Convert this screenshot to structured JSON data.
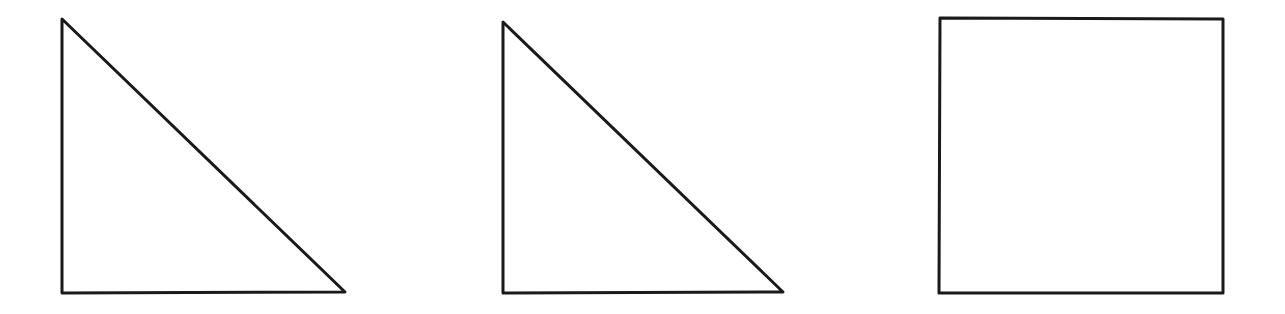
{
  "background": "#ffffff",
  "stroke_color": "#1a1a1a",
  "stroke_width": 3,
  "shapes": [
    {
      "name": "right-triangle-1",
      "type": "polygon",
      "points": [
        [
          62,
          19
        ],
        [
          62,
          293
        ],
        [
          345,
          292
        ]
      ]
    },
    {
      "name": "right-triangle-2",
      "type": "polygon",
      "points": [
        [
          503,
          22
        ],
        [
          503,
          293
        ],
        [
          783,
          292
        ]
      ]
    },
    {
      "name": "square",
      "type": "polygon",
      "points": [
        [
          940,
          18
        ],
        [
          1223,
          19
        ],
        [
          1223,
          293
        ],
        [
          939,
          293
        ]
      ]
    }
  ]
}
